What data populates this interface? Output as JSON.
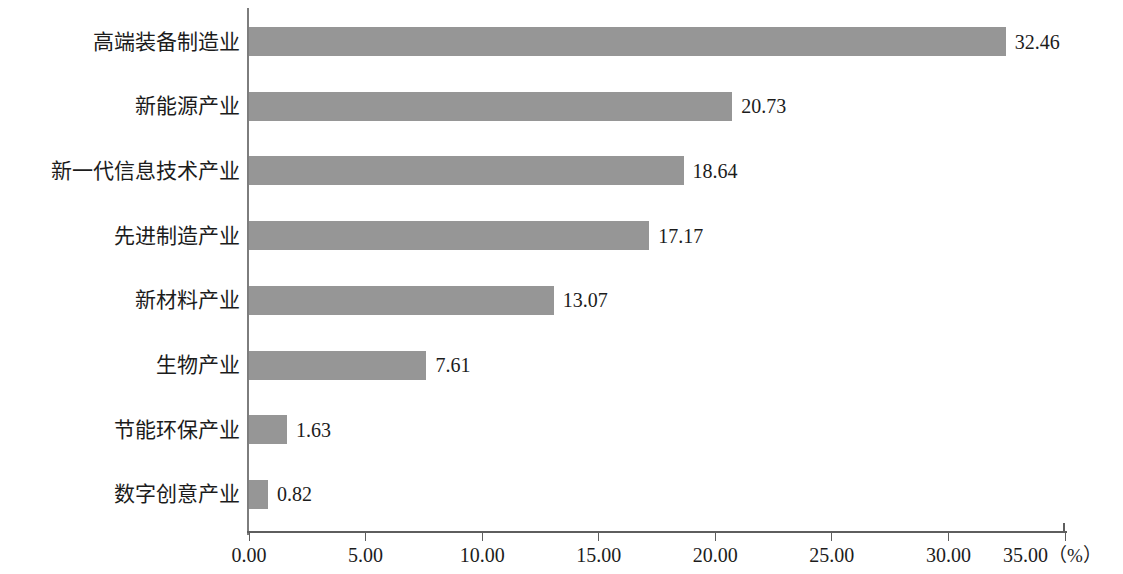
{
  "chart_data": {
    "type": "bar",
    "orientation": "horizontal",
    "title": "",
    "subtitle": "",
    "xlabel": "（%）",
    "ylabel": "",
    "categories": [
      "高端装备制造业",
      "新能源产业",
      "新一代信息技术产业",
      "先进制造产业",
      "新材料产业",
      "生物产业",
      "节能环保产业",
      "数字创意产业"
    ],
    "values": [
      32.46,
      20.73,
      18.64,
      17.17,
      13.07,
      7.61,
      1.63,
      0.82
    ],
    "value_labels": [
      "32.46",
      "20.73",
      "18.64",
      "17.17",
      "13.07",
      "7.61",
      "1.63",
      "0.82"
    ],
    "xlim": [
      0,
      35
    ],
    "xticks": [
      0,
      5,
      10,
      15,
      20,
      25,
      30,
      35
    ],
    "xtick_labels": [
      "0.00",
      "5.00",
      "10.00",
      "15.00",
      "20.00",
      "25.00",
      "30.00",
      "35.00"
    ],
    "unit_suffix": "（%）",
    "grid": false,
    "legend": null,
    "bar_color": "#969696",
    "axis_color": "#5e5e5e",
    "text_color": "#1c1c1c",
    "background": "#ffffff"
  }
}
